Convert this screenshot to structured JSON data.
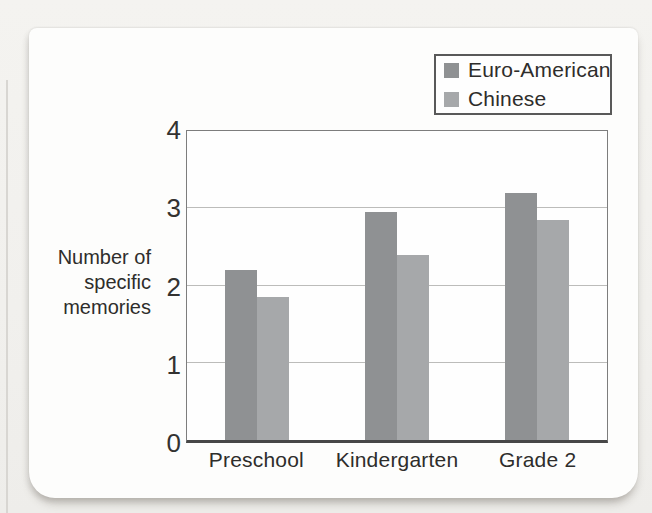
{
  "page": {
    "background_color": "#f1f0ed",
    "card_color": "#fdfdfc"
  },
  "chart_data": {
    "type": "bar",
    "title": "",
    "categories": [
      "Preschool",
      "Kindergarten",
      "Grade 2"
    ],
    "series": [
      {
        "name": "Euro-American",
        "color": "#8f9193",
        "values": [
          2.2,
          2.95,
          3.2
        ]
      },
      {
        "name": "Chinese",
        "color": "#a6a8aa",
        "values": [
          1.85,
          2.4,
          2.85
        ]
      }
    ],
    "ylabel_lines": [
      "Number of",
      "specific",
      "memories"
    ],
    "xlabel": "",
    "yticks": [
      0,
      1,
      2,
      3,
      4
    ],
    "ylim": [
      0,
      4
    ],
    "grid": "horizontal",
    "legend_position": "top-right"
  }
}
